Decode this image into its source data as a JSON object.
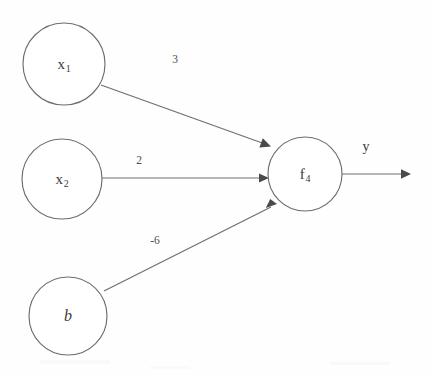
{
  "diagram": {
    "type": "neural-network-neuron",
    "background_color": "#fefefe",
    "stroke_color": "#6e6e6e",
    "text_color": "#3a3a3a",
    "nodes": [
      {
        "id": "x1",
        "label_main": "x",
        "label_sub": "1",
        "cx": 64,
        "cy": 64,
        "r": 41,
        "style": "roman"
      },
      {
        "id": "x2",
        "label_main": "x",
        "label_sub": "2",
        "cx": 62,
        "cy": 179,
        "r": 40,
        "style": "roman"
      },
      {
        "id": "b",
        "label_main": "b",
        "label_sub": "",
        "cx": 68,
        "cy": 316,
        "r": 39,
        "style": "italic"
      },
      {
        "id": "f4",
        "label_main": "f",
        "label_sub": "4",
        "cx": 305,
        "cy": 174,
        "r": 37,
        "style": "roman"
      }
    ],
    "edges": [
      {
        "id": "x1-to-f4",
        "from": "x1",
        "to": "f4",
        "weight": "3",
        "label_x": 175,
        "label_y": 59
      },
      {
        "id": "x2-to-f4",
        "from": "x2",
        "to": "f4",
        "weight": "2",
        "label_x": 139,
        "label_y": 160
      },
      {
        "id": "b-to-f4",
        "from": "b",
        "to": "f4",
        "weight": "-6",
        "label_x": 155,
        "label_y": 240
      }
    ],
    "output": {
      "id": "f4-output",
      "label": "y",
      "label_x": 366,
      "label_y": 147,
      "arrow_end_x": 410,
      "arrow_y": 174
    }
  }
}
